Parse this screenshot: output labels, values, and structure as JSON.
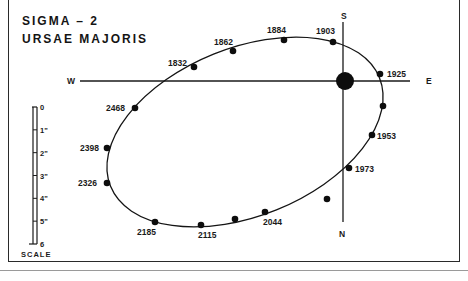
{
  "title": {
    "line1": "SIGMA – 2",
    "line2": "URSAE  MAJORIS"
  },
  "compass": {
    "west": "W",
    "east": "E",
    "south": "S",
    "north": "N"
  },
  "scale": {
    "label": "SCALE",
    "ticks": [
      "0",
      "1\"",
      "2\"",
      "3\"",
      "4\"",
      "5\"",
      "6"
    ]
  },
  "colors": {
    "ink": "#141414",
    "paper": "#ffffff",
    "frame": "#2a2a2a"
  },
  "orbit": {
    "primary": {
      "x": 345,
      "y": 81,
      "r": 9
    },
    "points": [
      {
        "year": "1832",
        "x": 194,
        "y": 67,
        "lx": 168,
        "ly": 66
      },
      {
        "year": "1862",
        "x": 233,
        "y": 51,
        "lx": 214,
        "ly": 45
      },
      {
        "year": "1884",
        "x": 284,
        "y": 40,
        "lx": 267,
        "ly": 33
      },
      {
        "year": "1903",
        "x": 333,
        "y": 42,
        "lx": 316,
        "ly": 34
      },
      {
        "year": "1925",
        "x": 380,
        "y": 74,
        "lx": 387,
        "ly": 77
      },
      {
        "year": "",
        "x": 383,
        "y": 106,
        "lx": 0,
        "ly": 0
      },
      {
        "year": "1953",
        "x": 372,
        "y": 135,
        "lx": 377,
        "ly": 139
      },
      {
        "year": "1973",
        "x": 349,
        "y": 168,
        "lx": 355,
        "ly": 172
      },
      {
        "year": "",
        "x": 327,
        "y": 199,
        "lx": 0,
        "ly": 0
      },
      {
        "year": "2044",
        "x": 265,
        "y": 212,
        "lx": 263,
        "ly": 225
      },
      {
        "year": "",
        "x": 235,
        "y": 219,
        "lx": 0,
        "ly": 0
      },
      {
        "year": "2115",
        "x": 201,
        "y": 225,
        "lx": 198,
        "ly": 238
      },
      {
        "year": "2185",
        "x": 155,
        "y": 222,
        "lx": 137,
        "ly": 235
      },
      {
        "year": "2326",
        "x": 107,
        "y": 183,
        "lx": 78,
        "ly": 186
      },
      {
        "year": "2398",
        "x": 107,
        "y": 148,
        "lx": 80,
        "ly": 151
      },
      {
        "year": "2468",
        "x": 135,
        "y": 108,
        "lx": 106,
        "ly": 111
      }
    ]
  }
}
